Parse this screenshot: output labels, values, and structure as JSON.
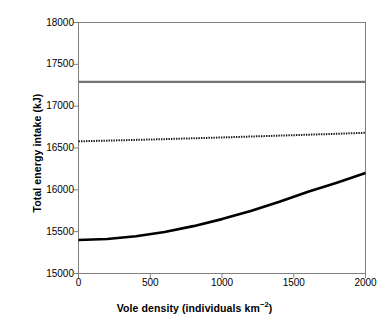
{
  "chart_data": {
    "type": "line",
    "title": "",
    "xlabel": "Vole density (individuals km",
    "xlabel_sup": "−2",
    "xlabel_tail": ")",
    "xlabel_full": "Vole density (individuals km−2)",
    "ylabel": "Total energy intake (kJ)",
    "xlim": [
      0,
      2000
    ],
    "ylim": [
      15000,
      18000
    ],
    "xticks": [
      0,
      500,
      1000,
      1500,
      2000
    ],
    "xtick_labels": [
      "0",
      "500",
      "1000",
      "1500",
      "2000"
    ],
    "yticks": [
      15000,
      15500,
      16000,
      16500,
      17000,
      17500,
      18000
    ],
    "ytick_labels": [
      "15000",
      "15500",
      "16000",
      "16500",
      "17000",
      "17500",
      "18000"
    ],
    "grid": false,
    "legend": "none",
    "x": [
      0,
      200,
      400,
      600,
      800,
      1000,
      1200,
      1400,
      1600,
      1800,
      2000
    ],
    "series": [
      {
        "name": "upper-flat-line",
        "style": "solid",
        "color": "#737373",
        "width": 2.2,
        "values": [
          17290,
          17290,
          17290,
          17290,
          17290,
          17290,
          17290,
          17290,
          17290,
          17290,
          17290
        ]
      },
      {
        "name": "middle-dotted-line",
        "style": "dotted",
        "color": "#1a1a1a",
        "width": 2.0,
        "values": [
          16580,
          16588,
          16597,
          16606,
          16616,
          16626,
          16637,
          16648,
          16659,
          16670,
          16682
        ]
      },
      {
        "name": "lower-rising-curve",
        "style": "solid",
        "color": "#000000",
        "width": 2.6,
        "values": [
          15400,
          15412,
          15445,
          15497,
          15566,
          15650,
          15748,
          15858,
          15978,
          16085,
          16200
        ]
      }
    ]
  },
  "axes": {
    "frame_color": "#808080",
    "tick_color": "#808080"
  }
}
